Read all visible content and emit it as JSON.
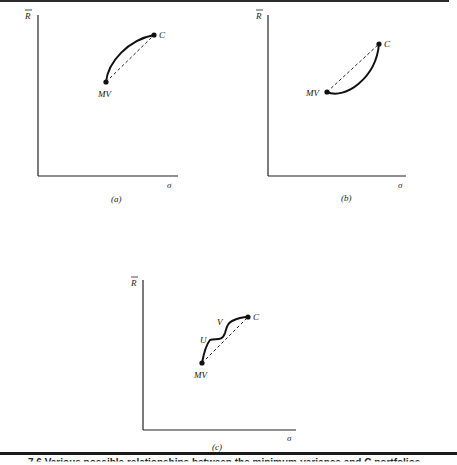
{
  "figure": {
    "caption": "7.6 Various possible relationships between the minimum-variance and C portfolios",
    "panels": [
      {
        "id": "a",
        "panel_label": "(a)",
        "y_axis_label": "R",
        "x_axis_label": "σ",
        "points": [
          {
            "name": "MV",
            "label": "MV"
          },
          {
            "name": "C",
            "label": "C"
          }
        ],
        "curve": "concave arc above straight line from MV to C"
      },
      {
        "id": "b",
        "panel_label": "(b)",
        "y_axis_label": "R",
        "x_axis_label": "σ",
        "points": [
          {
            "name": "MV",
            "label": "MV"
          },
          {
            "name": "C",
            "label": "C"
          }
        ],
        "curve": "convex arc below straight line from MV to C"
      },
      {
        "id": "c",
        "panel_label": "(c)",
        "y_axis_label": "R",
        "x_axis_label": "σ",
        "points": [
          {
            "name": "MV",
            "label": "MV"
          },
          {
            "name": "U",
            "label": "U"
          },
          {
            "name": "V",
            "label": "V"
          },
          {
            "name": "C",
            "label": "C"
          }
        ],
        "curve": "wavy frontier from MV through U and V to C, above dashed line"
      }
    ]
  }
}
